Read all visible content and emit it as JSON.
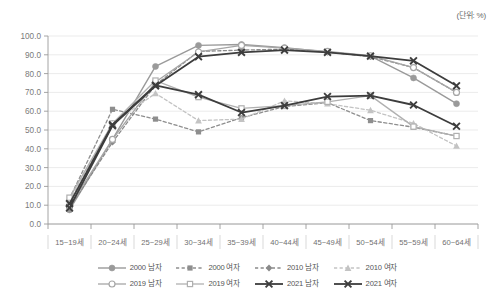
{
  "unit_label": "(단위: %)",
  "chart_data": {
    "type": "line",
    "title": "",
    "xlabel": "",
    "ylabel": "",
    "ylim": [
      0,
      100
    ],
    "ytick_step": 10,
    "grid": true,
    "legend_position": "bottom",
    "ytick_labels": [
      "0.0",
      "10.0",
      "20.0",
      "30.0",
      "40.0",
      "50.0",
      "60.0",
      "70.0",
      "80.0",
      "90.0",
      "100.0"
    ],
    "categories": [
      "15~19세",
      "20~24세",
      "25~29세",
      "30~34세",
      "35~39세",
      "40~44세",
      "45~49세",
      "50~54세",
      "55~59세",
      "60~64세"
    ],
    "series": [
      {
        "name": "2000 남자",
        "values": [
          7.5,
          45.0,
          83.8,
          95.0,
          95.5,
          93.8,
          91.5,
          89.3,
          77.7,
          64.0
        ],
        "color": "#9a9a9a",
        "dash": "none",
        "marker": "circle-filled",
        "width": 1.4
      },
      {
        "name": "2000 여자",
        "values": [
          13.5,
          61.0,
          55.8,
          49.0,
          56.5,
          62.5,
          64.5,
          55.0,
          51.5,
          46.8
        ],
        "color": "#8e8e8e",
        "dash": "dashed",
        "marker": "square-filled",
        "width": 1.3
      },
      {
        "name": "2010 남자",
        "values": [
          8.5,
          43.5,
          74.0,
          91.8,
          92.5,
          93.0,
          91.5,
          89.0,
          83.2,
          70.0
        ],
        "color": "#8a8a8a",
        "dash": "dashed",
        "marker": "diamond-filled",
        "width": 1.3
      },
      {
        "name": "2010 여자",
        "values": [
          12.5,
          53.5,
          69.5,
          55.0,
          55.8,
          65.5,
          64.0,
          60.5,
          53.5,
          41.5
        ],
        "color": "#c3c3c3",
        "dash": "dashed",
        "marker": "triangle-filled",
        "width": 1.3
      },
      {
        "name": "2019 남자",
        "values": [
          9.5,
          45.0,
          75.5,
          91.5,
          95.0,
          93.5,
          91.8,
          89.5,
          83.2,
          70.0
        ],
        "color": "#a6a6a6",
        "dash": "none",
        "marker": "circle-open",
        "width": 1.3
      },
      {
        "name": "2019 여자",
        "values": [
          14.0,
          53.5,
          76.3,
          67.5,
          61.5,
          63.0,
          65.0,
          68.3,
          51.8,
          46.8
        ],
        "color": "#b0b0b0",
        "dash": "none",
        "marker": "square-open",
        "width": 1.3
      },
      {
        "name": "2021 남자",
        "values": [
          8.5,
          52.3,
          73.5,
          89.0,
          91.3,
          92.5,
          91.3,
          89.3,
          86.8,
          73.5
        ],
        "color": "#3d3d3d",
        "dash": "none",
        "marker": "x-bold",
        "width": 1.8
      },
      {
        "name": "2021 여자",
        "values": [
          10.8,
          52.8,
          73.8,
          68.8,
          59.3,
          63.0,
          67.8,
          68.3,
          63.3,
          52.0
        ],
        "color": "#3d3d3d",
        "dash": "none",
        "marker": "x-bold",
        "width": 1.8
      }
    ]
  },
  "legend": {
    "rows": [
      [
        {
          "label": "2000 남자",
          "series_index": 0
        },
        {
          "label": "2000 여자",
          "series_index": 1
        },
        {
          "label": "2010 남자",
          "series_index": 2
        },
        {
          "label": "2010 여자",
          "series_index": 3
        }
      ],
      [
        {
          "label": "2019 남자",
          "series_index": 4
        },
        {
          "label": "2019 여자",
          "series_index": 5
        },
        {
          "label": "2021 남자",
          "series_index": 6
        },
        {
          "label": "2021 여자",
          "series_index": 7
        }
      ]
    ]
  }
}
